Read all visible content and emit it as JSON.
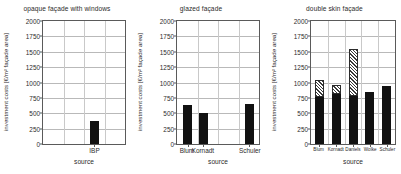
{
  "figure": {
    "axis_label_y": "investment costs [€/m² façade area]",
    "axis_label_x": "source",
    "yticks": [
      "0",
      "250",
      "500",
      "750",
      "1000",
      "1250",
      "1500",
      "1750",
      "2000"
    ],
    "colors": {
      "bar_solid": "#111111",
      "bar_hatch_outline": "#2b2b2b",
      "grid": "#b9b9b9",
      "axis": "#5a5a5a",
      "text": "#2b2b2b"
    }
  },
  "chart_data": [
    {
      "type": "bar",
      "title": "opaque façade with windows",
      "xlabel": "source",
      "ylabel": "investment costs [€/m² façade area]",
      "ylim": [
        0,
        2000
      ],
      "ytick_values": [
        0,
        250,
        500,
        750,
        1000,
        1250,
        1500,
        1750,
        2000
      ],
      "grid": true,
      "legend": "none",
      "categories": [
        "IBP"
      ],
      "values": [
        380
      ],
      "series": [
        {
          "name": "base",
          "pattern": "solid",
          "values": [
            380
          ]
        },
        {
          "name": "range",
          "pattern": "hatched",
          "values": [
            0
          ]
        }
      ]
    },
    {
      "type": "bar",
      "title": "glazed façade",
      "xlabel": "source",
      "ylabel": "investment costs [€/m² façade area]",
      "ylim": [
        0,
        2000
      ],
      "ytick_values": [
        0,
        250,
        500,
        750,
        1000,
        1250,
        1500,
        1750,
        2000
      ],
      "grid": true,
      "legend": "none",
      "categories": [
        "Blum",
        "Kornadt",
        "Schuler"
      ],
      "values": [
        640,
        505,
        645
      ],
      "series": [
        {
          "name": "base",
          "pattern": "solid",
          "values": [
            640,
            505,
            645
          ]
        },
        {
          "name": "range",
          "pattern": "hatched",
          "values": [
            0,
            0,
            0
          ]
        }
      ]
    },
    {
      "type": "bar",
      "title": "double skin façade",
      "xlabel": "source",
      "ylabel": "investment costs [€/m² façade area]",
      "ylim": [
        0,
        2000
      ],
      "ytick_values": [
        0,
        250,
        500,
        750,
        1000,
        1250,
        1500,
        1750,
        2000
      ],
      "grid": true,
      "legend": "none",
      "stacked": true,
      "categories": [
        "Blum",
        "Kornadt",
        "Daniels",
        "Wolke",
        "Schuler"
      ],
      "values": [
        1035,
        965,
        1550,
        840,
        940
      ],
      "series": [
        {
          "name": "base",
          "pattern": "solid",
          "values": [
            770,
            820,
            780,
            840,
            940
          ]
        },
        {
          "name": "range",
          "pattern": "hatched",
          "values": [
            265,
            145,
            770,
            0,
            0
          ]
        }
      ]
    }
  ],
  "panels": [
    {
      "id": "opaque-facade-with-windows",
      "title": "opaque façade with windows",
      "xaxis_title": "source",
      "ylabel": "investment costs [€/m² façade area]",
      "ticks": [
        "0",
        "250",
        "500",
        "750",
        "1000",
        "1250",
        "1500",
        "1750",
        "2000"
      ],
      "categories": [
        "IBP"
      ],
      "bars": [
        {
          "label": "IBP",
          "solid": 380,
          "hatch": 0,
          "total": 380
        }
      ]
    },
    {
      "id": "glazed-facade",
      "title": "glazed façade",
      "xaxis_title": "source",
      "ylabel": "investment costs [€/m² façade area]",
      "ticks": [
        "0",
        "250",
        "500",
        "750",
        "1000",
        "1250",
        "1500",
        "1750",
        "2000"
      ],
      "categories": [
        "Blum",
        "Kornadt",
        "Schuler"
      ],
      "bars": [
        {
          "label": "Blum",
          "solid": 640,
          "hatch": 0,
          "total": 640
        },
        {
          "label": "Kornadt",
          "solid": 505,
          "hatch": 0,
          "total": 505
        },
        {
          "label": "Schuler",
          "solid": 645,
          "hatch": 0,
          "total": 645
        }
      ]
    },
    {
      "id": "double-skin-facade",
      "title": "double skin façade",
      "xaxis_title": "source",
      "ylabel": "investment costs [€/m² façade area]",
      "ticks": [
        "0",
        "250",
        "500",
        "750",
        "1000",
        "1250",
        "1500",
        "1750",
        "2000"
      ],
      "categories": [
        "Blum",
        "Kornadt",
        "Daniels",
        "Wolke",
        "Schuler"
      ],
      "bars": [
        {
          "label": "Blum",
          "solid": 770,
          "hatch": 265,
          "total": 1035
        },
        {
          "label": "Kornadt",
          "solid": 820,
          "hatch": 145,
          "total": 965
        },
        {
          "label": "Daniels",
          "solid": 780,
          "hatch": 770,
          "total": 1550
        },
        {
          "label": "Wolke",
          "solid": 840,
          "hatch": 0,
          "total": 840
        },
        {
          "label": "Schuler",
          "solid": 940,
          "hatch": 0,
          "total": 940
        }
      ]
    }
  ]
}
